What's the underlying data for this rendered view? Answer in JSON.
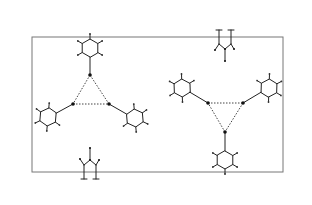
{
  "figure": {
    "title": "",
    "colors": {
      "cell": "#777777",
      "bond": "#222222",
      "hbond": "#444444",
      "atom": "#111111"
    },
    "unit_cell": {
      "x": 32,
      "y": 37,
      "width": 251,
      "height": 135
    },
    "motifs": [
      {
        "name": "left-trimer",
        "core": [
          [
            90,
            75
          ],
          [
            73,
            104
          ],
          [
            109,
            104
          ]
        ],
        "rings": [
          {
            "anchor": [
              90,
              75
            ],
            "center": [
              90,
              48
            ],
            "angle": -90
          },
          {
            "anchor": [
              73,
              104
            ],
            "center": [
              48,
              117
            ],
            "angle": 155
          },
          {
            "anchor": [
              109,
              104
            ],
            "center": [
              135,
              118
            ],
            "angle": 25
          }
        ]
      },
      {
        "name": "right-trimer",
        "core": [
          [
            208,
            103
          ],
          [
            243,
            103
          ],
          [
            225,
            132
          ]
        ],
        "rings": [
          {
            "anchor": [
              208,
              103
            ],
            "center": [
              182,
              88
            ],
            "angle": -152
          },
          {
            "anchor": [
              243,
              103
            ],
            "center": [
              269,
              88
            ],
            "angle": -28
          },
          {
            "anchor": [
              225,
              132
            ],
            "center": [
              225,
              160
            ],
            "angle": 90
          }
        ]
      }
    ],
    "edge_fragments": [
      {
        "name": "top-fragment",
        "x": 225,
        "y": 37,
        "flip": false
      },
      {
        "name": "bottom-fragment",
        "x": 90,
        "y": 172,
        "flip": true
      }
    ]
  }
}
